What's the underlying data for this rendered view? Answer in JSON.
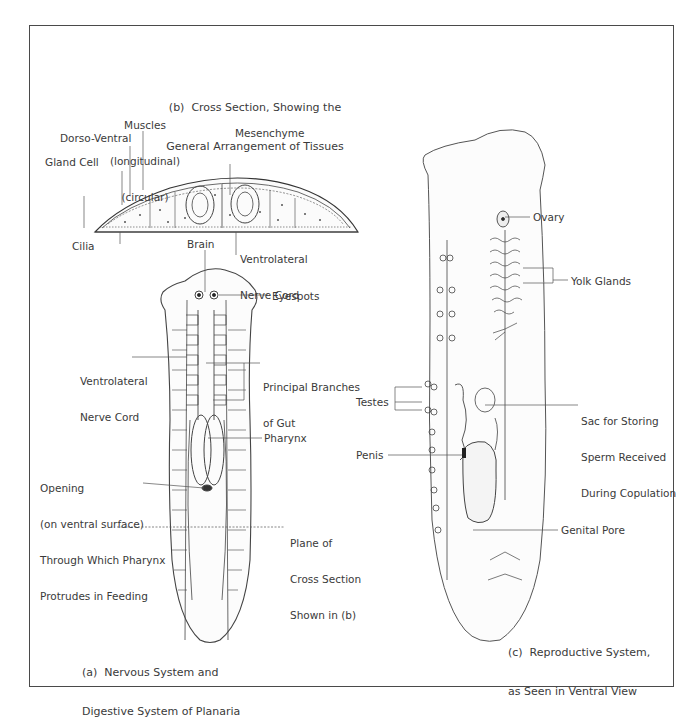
{
  "figure": {
    "panels": {
      "a": {
        "caption_line1": "(a)  Nervous System and",
        "caption_line2": "Digestive System of Planaria"
      },
      "b": {
        "caption_line1": "(b)  Cross Section, Showing the",
        "caption_line2": "General Arrangement of Tissues"
      },
      "c": {
        "caption_line1": "(c)  Reproductive System,",
        "caption_line2": "as Seen in Ventral View"
      }
    },
    "labels_b": {
      "muscles": "Muscles",
      "longitudinal": "(longitudinal)",
      "circular": "(circular)",
      "dorso_ventral": "Dorso-Ventral",
      "mesenchyme": "Mesenchyme",
      "gland_cell": "Gland Cell",
      "cilia": "Cilia",
      "ventrolateral_1": "Ventrolateral",
      "ventrolateral_2": "Nerve Cord"
    },
    "labels_a": {
      "brain": "Brain",
      "eyespots": "Eyespots",
      "ventrolateral_1": "Ventrolateral",
      "ventrolateral_2": "Nerve Cord",
      "principal_1": "Principal Branches",
      "principal_2": "of Gut",
      "pharynx": "Pharynx",
      "opening_1": "Opening",
      "opening_2": "(on ventral surface)",
      "opening_3": "Through Which Pharynx",
      "opening_4": "Protrudes in Feeding",
      "plane_1": "Plane of",
      "plane_2": "Cross Section",
      "plane_3": "Shown in (b)"
    },
    "labels_c": {
      "ovary": "Ovary",
      "yolk_glands": "Yolk Glands",
      "testes": "Testes",
      "sac_1": "Sac for Storing",
      "sac_2": "Sperm Received",
      "sac_3": "During Copulation",
      "penis": "Penis",
      "genital_pore": "Genital Pore"
    }
  }
}
